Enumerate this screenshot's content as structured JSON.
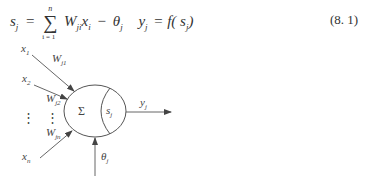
{
  "equation": {
    "lhs": "s",
    "lhs_sub": "j",
    "equals": "=",
    "sum_symbol": "∑",
    "sum_upper": "n",
    "sum_lower": "i = 1",
    "term_w": "W",
    "term_w_sub": "ji",
    "term_x": "x",
    "term_x_sub": "i",
    "minus": "−",
    "theta": "θ",
    "theta_sub": "j",
    "output": "y",
    "output_sub": "j",
    "func": "= f( s",
    "func_sub": "j",
    "func_close": ")",
    "number": "(8. 1)"
  },
  "diagram": {
    "inputs": [
      {
        "label": "x",
        "sub": "1",
        "weight": "W",
        "weight_sub": "j1"
      },
      {
        "label": "x",
        "sub": "2",
        "weight": "W",
        "weight_sub": "j2"
      },
      {
        "label": "x",
        "sub": "n",
        "weight": "W",
        "weight_sub": "jn"
      }
    ],
    "ellipsis": "⋮",
    "sum_label": "Σ",
    "activation_label": "s",
    "activation_sub": "j",
    "output_label": "y",
    "output_sub": "j",
    "threshold_label": "θ",
    "threshold_sub": "j"
  }
}
